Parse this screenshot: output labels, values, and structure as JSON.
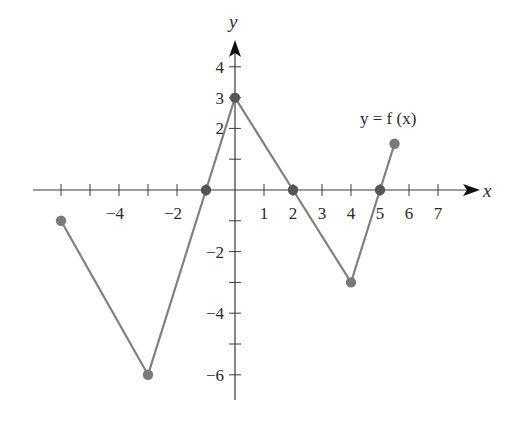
{
  "chart_data": {
    "type": "line",
    "title": "",
    "curve_label": "y = f (x)",
    "xlabel": "x",
    "ylabel": "y",
    "xlim": [
      -6.5,
      8
    ],
    "ylim": [
      -7,
      5
    ],
    "grid": false,
    "x_ticks": [
      -6,
      -5,
      -4,
      -3,
      -2,
      -1,
      1,
      2,
      3,
      4,
      5,
      6,
      7
    ],
    "x_tick_labels": [
      {
        "value": -4,
        "label": "−4"
      },
      {
        "value": -2,
        "label": "−2"
      },
      {
        "value": 1,
        "label": "1"
      },
      {
        "value": 2,
        "label": "2"
      },
      {
        "value": 3,
        "label": "3"
      },
      {
        "value": 4,
        "label": "4"
      },
      {
        "value": 5,
        "label": "5"
      },
      {
        "value": 6,
        "label": "6"
      },
      {
        "value": 7,
        "label": "7"
      }
    ],
    "y_ticks": [
      -6,
      -5,
      -4,
      -3,
      -2,
      -1,
      1,
      2,
      3,
      4
    ],
    "y_tick_labels": [
      {
        "value": 4,
        "label": "4"
      },
      {
        "value": 3,
        "label": "3"
      },
      {
        "value": 2,
        "label": "2"
      },
      {
        "value": -2,
        "label": "−2"
      },
      {
        "value": -4,
        "label": "−4"
      },
      {
        "value": -6,
        "label": "−6"
      }
    ],
    "series": [
      {
        "name": "f(x)",
        "color": "#808080",
        "points": [
          {
            "x": -6,
            "y": -1
          },
          {
            "x": -3,
            "y": -6
          },
          {
            "x": -1,
            "y": 0
          },
          {
            "x": 0,
            "y": 3
          },
          {
            "x": 2,
            "y": 0
          },
          {
            "x": 4,
            "y": -3
          },
          {
            "x": 5,
            "y": 0
          },
          {
            "x": 5.5,
            "y": 1.5
          }
        ]
      }
    ],
    "marked_points": [
      {
        "x": -6,
        "y": -1,
        "kind": "endpoint"
      },
      {
        "x": -3,
        "y": -6,
        "kind": "vertex"
      },
      {
        "x": -1,
        "y": 0,
        "kind": "x-intercept"
      },
      {
        "x": 0,
        "y": 3,
        "kind": "y-intercept"
      },
      {
        "x": 2,
        "y": 0,
        "kind": "x-intercept"
      },
      {
        "x": 4,
        "y": -3,
        "kind": "vertex"
      },
      {
        "x": 5,
        "y": 0,
        "kind": "x-intercept"
      },
      {
        "x": 5.5,
        "y": 1.5,
        "kind": "endpoint"
      }
    ],
    "colors": {
      "axis": "#3a3a3a",
      "curve": "#808080",
      "point": "#7a7a7a",
      "intercept_point": "#555555"
    }
  }
}
